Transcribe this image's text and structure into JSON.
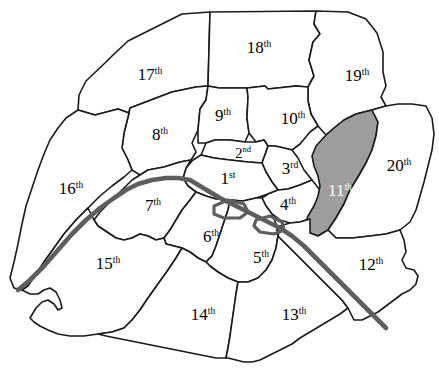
{
  "map": {
    "title": "Paris arrondissements map",
    "background_color": "#ffffff",
    "border_color": "#1a1a1a",
    "highlight_color": "#9d9d9d",
    "river_color": "#5e5e5e",
    "river_name": "Seine",
    "highlighted_district": "11th",
    "districts": [
      {
        "id": "1",
        "number": "1",
        "ordinal": "st",
        "label_x": 228,
        "label_y": 184,
        "highlighted": false,
        "small": false
      },
      {
        "id": "2",
        "number": "2",
        "ordinal": "nd",
        "label_x": 243,
        "label_y": 158,
        "highlighted": false,
        "small": true
      },
      {
        "id": "3",
        "number": "3",
        "ordinal": "rd",
        "label_x": 290,
        "label_y": 174,
        "highlighted": false,
        "small": false
      },
      {
        "id": "4",
        "number": "4",
        "ordinal": "th",
        "label_x": 288,
        "label_y": 210,
        "highlighted": false,
        "small": false
      },
      {
        "id": "5",
        "number": "5",
        "ordinal": "th",
        "label_x": 261,
        "label_y": 263,
        "highlighted": false,
        "small": false
      },
      {
        "id": "6",
        "number": "6",
        "ordinal": "th",
        "label_x": 211,
        "label_y": 242,
        "highlighted": false,
        "small": false
      },
      {
        "id": "7",
        "number": "7",
        "ordinal": "th",
        "label_x": 153,
        "label_y": 211,
        "highlighted": false,
        "small": false
      },
      {
        "id": "8",
        "number": "8",
        "ordinal": "th",
        "label_x": 160,
        "label_y": 140,
        "highlighted": false,
        "small": false
      },
      {
        "id": "9",
        "number": "9",
        "ordinal": "th",
        "label_x": 223,
        "label_y": 121,
        "highlighted": false,
        "small": false
      },
      {
        "id": "10",
        "number": "10",
        "ordinal": "th",
        "label_x": 293,
        "label_y": 124,
        "highlighted": false,
        "small": false
      },
      {
        "id": "11",
        "number": "11",
        "ordinal": "th",
        "label_x": 340,
        "label_y": 196,
        "highlighted": true,
        "small": false
      },
      {
        "id": "12",
        "number": "12",
        "ordinal": "th",
        "label_x": 371,
        "label_y": 270,
        "highlighted": false,
        "small": false
      },
      {
        "id": "13",
        "number": "13",
        "ordinal": "th",
        "label_x": 294,
        "label_y": 320,
        "highlighted": false,
        "small": false
      },
      {
        "id": "14",
        "number": "14",
        "ordinal": "th",
        "label_x": 203,
        "label_y": 320,
        "highlighted": false,
        "small": false
      },
      {
        "id": "15",
        "number": "15",
        "ordinal": "th",
        "label_x": 108,
        "label_y": 269,
        "highlighted": false,
        "small": false
      },
      {
        "id": "16",
        "number": "16",
        "ordinal": "th",
        "label_x": 71,
        "label_y": 194,
        "highlighted": false,
        "small": false
      },
      {
        "id": "17",
        "number": "17",
        "ordinal": "th",
        "label_x": 150,
        "label_y": 80,
        "highlighted": false,
        "small": false
      },
      {
        "id": "18",
        "number": "18",
        "ordinal": "th",
        "label_x": 259,
        "label_y": 53,
        "highlighted": false,
        "small": false
      },
      {
        "id": "19",
        "number": "19",
        "ordinal": "th",
        "label_x": 357,
        "label_y": 81,
        "highlighted": false,
        "small": false
      },
      {
        "id": "20",
        "number": "20",
        "ordinal": "th",
        "label_x": 399,
        "label_y": 171,
        "highlighted": false,
        "small": false
      }
    ]
  }
}
